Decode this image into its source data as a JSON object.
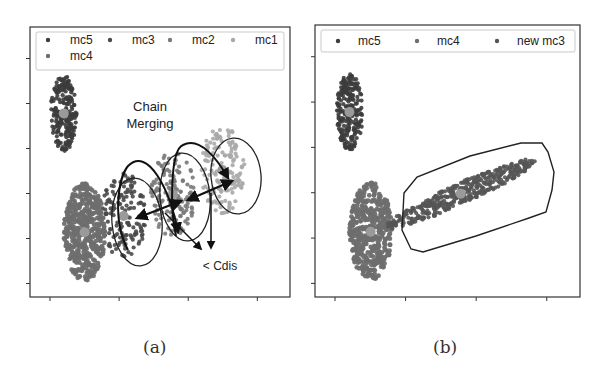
{
  "chart_data": [
    {
      "type": "scatter",
      "panel_label": "(a)",
      "title": "",
      "xlabel": "",
      "ylabel": "",
      "grid": false,
      "legend_position": "top",
      "legend": [
        "mc5",
        "mc3",
        "mc2",
        "mc1",
        "mc4"
      ],
      "series": [
        {
          "name": "mc5",
          "color": "#3c3c3c",
          "center": [
            0.13,
            0.68
          ],
          "spread": [
            0.05,
            0.14
          ],
          "points": 220
        },
        {
          "name": "mc3",
          "color": "#4a4a4a",
          "center": [
            0.36,
            0.3
          ],
          "spread": [
            0.085,
            0.16
          ],
          "points": 150
        },
        {
          "name": "mc2",
          "color": "#7a7a7a",
          "center": [
            0.55,
            0.38
          ],
          "spread": [
            0.085,
            0.16
          ],
          "points": 150
        },
        {
          "name": "mc1",
          "color": "#a8a8a8",
          "center": [
            0.74,
            0.47
          ],
          "spread": [
            0.085,
            0.16
          ],
          "points": 150
        },
        {
          "name": "mc4",
          "color": "#6e6e6e",
          "center": [
            0.21,
            0.24
          ],
          "spread": [
            0.08,
            0.18
          ],
          "points": 420
        }
      ],
      "annotations": [
        {
          "text": "Chain Merging",
          "type": "label"
        },
        {
          "text": "< Cdis",
          "type": "label"
        }
      ],
      "axis_ticks": {
        "x": 4,
        "y": 6,
        "labels_visible": false
      }
    },
    {
      "type": "scatter",
      "panel_label": "(b)",
      "title": "",
      "xlabel": "",
      "ylabel": "",
      "grid": false,
      "legend_position": "top",
      "legend": [
        "mc5",
        "mc4",
        "new mc3"
      ],
      "series": [
        {
          "name": "mc5",
          "color": "#3c3c3c",
          "center": [
            0.13,
            0.68
          ],
          "spread": [
            0.05,
            0.14
          ],
          "points": 220
        },
        {
          "name": "mc4",
          "color": "#6e6e6e",
          "center": [
            0.21,
            0.24
          ],
          "spread": [
            0.08,
            0.18
          ],
          "points": 420
        },
        {
          "name": "new mc3",
          "color": "#555555",
          "center": [
            0.55,
            0.38
          ],
          "spread": [
            0.28,
            0.16
          ],
          "points": 420
        }
      ],
      "annotations": [
        {
          "text": "convex hull around merged cluster",
          "type": "shape"
        }
      ],
      "axis_ticks": {
        "x": 4,
        "y": 6,
        "labels_visible": false
      }
    }
  ],
  "panels": {
    "a": {
      "caption": "(a)",
      "legend": [
        {
          "label": "mc5",
          "color": "#3c3c3c"
        },
        {
          "label": "mc3",
          "color": "#4a4a4a"
        },
        {
          "label": "mc2",
          "color": "#7a7a7a"
        },
        {
          "label": "mc1",
          "color": "#a8a8a8"
        },
        {
          "label": "mc4",
          "color": "#6e6e6e"
        }
      ],
      "annotation_chain": "Chain",
      "annotation_merging": "Merging",
      "annotation_cdis": "< Cdis"
    },
    "b": {
      "caption": "(b)",
      "legend": [
        {
          "label": "mc5",
          "color": "#3c3c3c"
        },
        {
          "label": "mc4",
          "color": "#6e6e6e"
        },
        {
          "label": "new mc3",
          "color": "#555555"
        }
      ]
    }
  }
}
